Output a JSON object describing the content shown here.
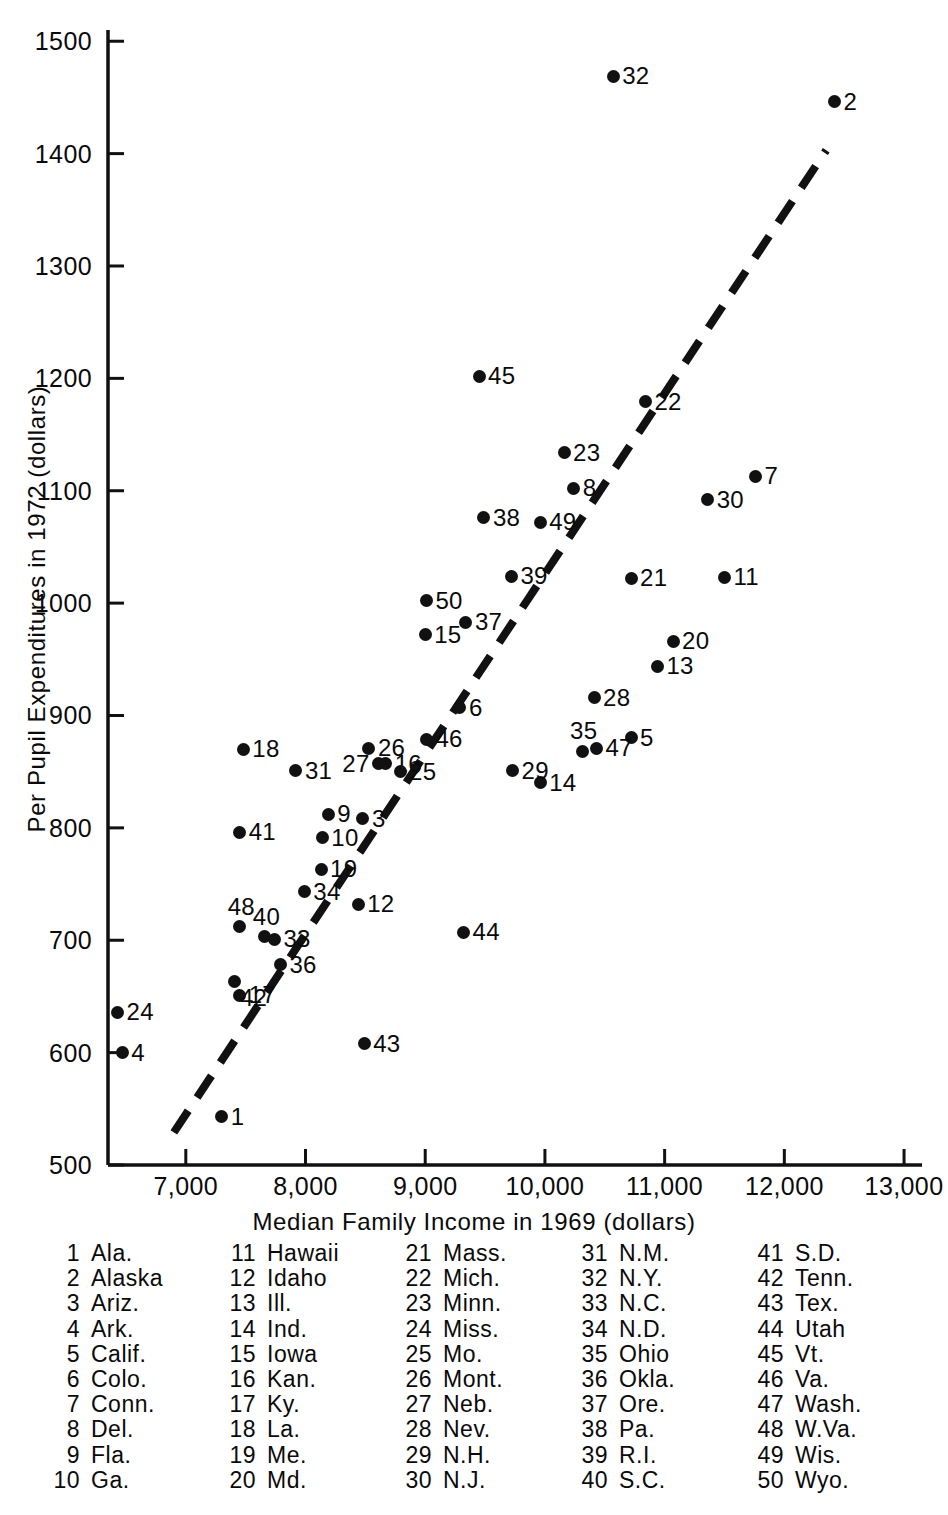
{
  "chart_data": {
    "type": "scatter",
    "title": "",
    "xlabel": "Median Family Income in 1969 (dollars)",
    "ylabel": "Per Pupil Expenditures in 1972 (dollars)",
    "xlim": [
      6350,
      13150
    ],
    "ylim": [
      500,
      1510
    ],
    "xticks": [
      7000,
      8000,
      9000,
      10000,
      11000,
      12000,
      13000
    ],
    "xticklabels": [
      "7,000",
      "8,000",
      "9,000",
      "10,000",
      "11,000",
      "12,000",
      "13,000"
    ],
    "yticks": [
      500,
      600,
      700,
      800,
      900,
      1000,
      1100,
      1200,
      1300,
      1400,
      1500
    ],
    "yticklabels": [
      "500",
      "600",
      "700",
      "800",
      "900",
      "1000",
      "1100",
      "1200",
      "1300",
      "1400",
      "1500"
    ],
    "grid": false,
    "legend_position": "below-plot",
    "marker_color": "#111111",
    "trendline": {
      "style": "dashed",
      "color": "#111111",
      "x_start": 6900,
      "y_start": 529,
      "x_end": 12350,
      "y_end": 1403
    },
    "points": [
      {
        "id": 1,
        "label": "1",
        "name": "Ala.",
        "x": 7300,
        "y": 543,
        "lp": "lbl-r"
      },
      {
        "id": 2,
        "label": "2",
        "name": "Alaska",
        "x": 12420,
        "y": 1446,
        "lp": "lbl-r"
      },
      {
        "id": 3,
        "label": "3",
        "name": "Ariz.",
        "x": 8480,
        "y": 808,
        "lp": "lbl-r"
      },
      {
        "id": 4,
        "label": "4",
        "name": "Ark.",
        "x": 6470,
        "y": 600,
        "lp": "lbl-r"
      },
      {
        "id": 5,
        "label": "5",
        "name": "Calif.",
        "x": 10720,
        "y": 880,
        "lp": "lbl-r"
      },
      {
        "id": 6,
        "label": "6",
        "name": "Colo.",
        "x": 9290,
        "y": 907,
        "lp": "lbl-r"
      },
      {
        "id": 7,
        "label": "7",
        "name": "Conn.",
        "x": 11760,
        "y": 1113,
        "lp": "lbl-r"
      },
      {
        "id": 8,
        "label": "8",
        "name": "Del.",
        "x": 10240,
        "y": 1102,
        "lp": "lbl-r"
      },
      {
        "id": 9,
        "label": "9",
        "name": "Fla.",
        "x": 8190,
        "y": 812,
        "lp": "lbl-r"
      },
      {
        "id": 10,
        "label": "10",
        "name": "Ga.",
        "x": 8140,
        "y": 791,
        "lp": "lbl-r"
      },
      {
        "id": 11,
        "label": "11",
        "name": "Hawaii",
        "x": 11500,
        "y": 1023,
        "lp": "lbl-r"
      },
      {
        "id": 12,
        "label": "12",
        "name": "Idaho",
        "x": 8440,
        "y": 732,
        "lp": "lbl-r"
      },
      {
        "id": 13,
        "label": "13",
        "name": "Ill.",
        "x": 10940,
        "y": 944,
        "lp": "lbl-r"
      },
      {
        "id": 14,
        "label": "14",
        "name": "Ind.",
        "x": 9960,
        "y": 840,
        "lp": "lbl-r"
      },
      {
        "id": 15,
        "label": "15",
        "name": "Iowa",
        "x": 9000,
        "y": 972,
        "lp": "lbl-r"
      },
      {
        "id": 16,
        "label": "16",
        "name": "Kan.",
        "x": 8670,
        "y": 857,
        "lp": "lbl-r"
      },
      {
        "id": 17,
        "label": "17",
        "name": "Ky.",
        "x": 7450,
        "y": 651,
        "lp": "lbl-r"
      },
      {
        "id": 18,
        "label": "18",
        "name": "La.",
        "x": 7480,
        "y": 870,
        "lp": "lbl-r"
      },
      {
        "id": 19,
        "label": "19",
        "name": "Me.",
        "x": 8130,
        "y": 763,
        "lp": "lbl-r"
      },
      {
        "id": 20,
        "label": "20",
        "name": "Md.",
        "x": 11070,
        "y": 966,
        "lp": "lbl-r"
      },
      {
        "id": 21,
        "label": "21",
        "name": "Mass.",
        "x": 10720,
        "y": 1022,
        "lp": "lbl-r"
      },
      {
        "id": 22,
        "label": "22",
        "name": "Mich.",
        "x": 10840,
        "y": 1179,
        "lp": "lbl-r"
      },
      {
        "id": 23,
        "label": "23",
        "name": "Minn.",
        "x": 10160,
        "y": 1134,
        "lp": "lbl-r"
      },
      {
        "id": 24,
        "label": "24",
        "name": "Miss.",
        "x": 6430,
        "y": 636,
        "lp": "lbl-r"
      },
      {
        "id": 25,
        "label": "25",
        "name": "Mo.",
        "x": 8790,
        "y": 850,
        "lp": "lbl-r"
      },
      {
        "id": 26,
        "label": "26",
        "name": "Mont.",
        "x": 8530,
        "y": 871,
        "lp": "lbl-r"
      },
      {
        "id": 27,
        "label": "27",
        "name": "Neb.",
        "x": 8610,
        "y": 857,
        "lp": "lbl-l"
      },
      {
        "id": 28,
        "label": "28",
        "name": "Nev.",
        "x": 10410,
        "y": 916,
        "lp": "lbl-r"
      },
      {
        "id": 29,
        "label": "29",
        "name": "N.H.",
        "x": 9730,
        "y": 851,
        "lp": "lbl-r"
      },
      {
        "id": 30,
        "label": "30",
        "name": "N.J.",
        "x": 11360,
        "y": 1092,
        "lp": "lbl-r"
      },
      {
        "id": 31,
        "label": "31",
        "name": "N.M.",
        "x": 7920,
        "y": 851,
        "lp": "lbl-r"
      },
      {
        "id": 32,
        "label": "32",
        "name": "N.Y.",
        "x": 10570,
        "y": 1469,
        "lp": "lbl-r"
      },
      {
        "id": 33,
        "label": "33",
        "name": "N.C.",
        "x": 7740,
        "y": 701,
        "lp": "lbl-r"
      },
      {
        "id": 34,
        "label": "34",
        "name": "N.D.",
        "x": 7990,
        "y": 743,
        "lp": "lbl-r"
      },
      {
        "id": 35,
        "label": "35",
        "name": "Ohio",
        "x": 10310,
        "y": 868,
        "lp": "lbl-t"
      },
      {
        "id": 36,
        "label": "36",
        "name": "Okla.",
        "x": 7790,
        "y": 678,
        "lp": "lbl-r"
      },
      {
        "id": 37,
        "label": "37",
        "name": "Ore.",
        "x": 9340,
        "y": 983,
        "lp": "lbl-r"
      },
      {
        "id": 38,
        "label": "38",
        "name": "Pa.",
        "x": 9490,
        "y": 1076,
        "lp": "lbl-r"
      },
      {
        "id": 39,
        "label": "39",
        "name": "R.I.",
        "x": 9720,
        "y": 1024,
        "lp": "lbl-r"
      },
      {
        "id": 40,
        "label": "40",
        "name": "S.C.",
        "x": 7660,
        "y": 703,
        "lp": "lbl-t"
      },
      {
        "id": 41,
        "label": "41",
        "name": "S.D.",
        "x": 7450,
        "y": 796,
        "lp": "lbl-r"
      },
      {
        "id": 42,
        "label": "42",
        "name": "Tenn.",
        "x": 7410,
        "y": 663,
        "lp": "lbl-br"
      },
      {
        "id": 43,
        "label": "43",
        "name": "Tex.",
        "x": 8490,
        "y": 608,
        "lp": "lbl-r"
      },
      {
        "id": 44,
        "label": "44",
        "name": "Utah",
        "x": 9320,
        "y": 707,
        "lp": "lbl-r"
      },
      {
        "id": 45,
        "label": "45",
        "name": "Vt.",
        "x": 9450,
        "y": 1202,
        "lp": "lbl-r"
      },
      {
        "id": 46,
        "label": "46",
        "name": "Va.",
        "x": 9010,
        "y": 879,
        "lp": "lbl-r"
      },
      {
        "id": 47,
        "label": "47",
        "name": "Wash.",
        "x": 10430,
        "y": 871,
        "lp": "lbl-r"
      },
      {
        "id": 48,
        "label": "48",
        "name": "W.Va.",
        "x": 7450,
        "y": 712,
        "lp": "lbl-t"
      },
      {
        "id": 49,
        "label": "49",
        "name": "Wis.",
        "x": 9960,
        "y": 1072,
        "lp": "lbl-r"
      },
      {
        "id": 50,
        "label": "50",
        "name": "Wyo.",
        "x": 9010,
        "y": 1002,
        "lp": "lbl-r"
      }
    ]
  },
  "legend": {
    "columns": [
      [
        {
          "num": "1",
          "name": "Ala."
        },
        {
          "num": "2",
          "name": "Alaska"
        },
        {
          "num": "3",
          "name": "Ariz."
        },
        {
          "num": "4",
          "name": "Ark."
        },
        {
          "num": "5",
          "name": "Calif."
        },
        {
          "num": "6",
          "name": "Colo."
        },
        {
          "num": "7",
          "name": "Conn."
        },
        {
          "num": "8",
          "name": "Del."
        },
        {
          "num": "9",
          "name": "Fla."
        },
        {
          "num": "10",
          "name": "Ga."
        }
      ],
      [
        {
          "num": "11",
          "name": "Hawaii"
        },
        {
          "num": "12",
          "name": "Idaho"
        },
        {
          "num": "13",
          "name": "Ill."
        },
        {
          "num": "14",
          "name": "Ind."
        },
        {
          "num": "15",
          "name": "Iowa"
        },
        {
          "num": "16",
          "name": "Kan."
        },
        {
          "num": "17",
          "name": "Ky."
        },
        {
          "num": "18",
          "name": "La."
        },
        {
          "num": "19",
          "name": "Me."
        },
        {
          "num": "20",
          "name": "Md."
        }
      ],
      [
        {
          "num": "21",
          "name": "Mass."
        },
        {
          "num": "22",
          "name": "Mich."
        },
        {
          "num": "23",
          "name": "Minn."
        },
        {
          "num": "24",
          "name": "Miss."
        },
        {
          "num": "25",
          "name": "Mo."
        },
        {
          "num": "26",
          "name": "Mont."
        },
        {
          "num": "27",
          "name": "Neb."
        },
        {
          "num": "28",
          "name": "Nev."
        },
        {
          "num": "29",
          "name": "N.H."
        },
        {
          "num": "30",
          "name": "N.J."
        }
      ],
      [
        {
          "num": "31",
          "name": "N.M."
        },
        {
          "num": "32",
          "name": "N.Y."
        },
        {
          "num": "33",
          "name": "N.C."
        },
        {
          "num": "34",
          "name": "N.D."
        },
        {
          "num": "35",
          "name": "Ohio"
        },
        {
          "num": "36",
          "name": "Okla."
        },
        {
          "num": "37",
          "name": "Ore."
        },
        {
          "num": "38",
          "name": "Pa."
        },
        {
          "num": "39",
          "name": "R.I."
        },
        {
          "num": "40",
          "name": "S.C."
        }
      ],
      [
        {
          "num": "41",
          "name": "S.D."
        },
        {
          "num": "42",
          "name": "Tenn."
        },
        {
          "num": "43",
          "name": "Tex."
        },
        {
          "num": "44",
          "name": "Utah"
        },
        {
          "num": "45",
          "name": "Vt."
        },
        {
          "num": "46",
          "name": "Va."
        },
        {
          "num": "47",
          "name": "Wash."
        },
        {
          "num": "48",
          "name": "W.Va."
        },
        {
          "num": "49",
          "name": "Wis."
        },
        {
          "num": "50",
          "name": "Wyo."
        }
      ]
    ]
  }
}
